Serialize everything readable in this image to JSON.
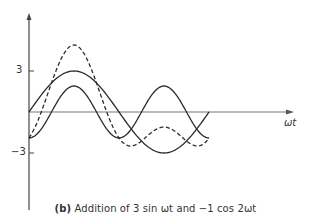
{
  "figure": {
    "caption_tag": "(b)",
    "caption_text": "Addition of 3 sin ωt and −1 cos 2ωt",
    "x_axis_label": "ωt",
    "y_ticks": [
      {
        "label": "3",
        "value": 3
      },
      {
        "label": "−3",
        "value": -3
      }
    ]
  },
  "chart_data": {
    "type": "line",
    "title": "(b) Addition of 3 sin ωt and −1 cos 2ωt",
    "xlabel": "ωt",
    "ylabel": "",
    "x_range_degrees": [
      0,
      360
    ],
    "yticks": [
      3,
      -3
    ],
    "grid": false,
    "legend": "none",
    "series": [
      {
        "name": "3 sin ωt",
        "style": "solid",
        "peak": 3,
        "trough": -3,
        "x_at_peak_deg": 90,
        "x_at_trough_deg": 270
      },
      {
        "name": "−1 cos 2ωt",
        "style": "solid",
        "values_at_deg": {
          "0": -1,
          "90": 1,
          "180": -1,
          "270": 1,
          "360": -1
        }
      },
      {
        "name": "3 sin ωt − 1 cos 2ωt (sum)",
        "style": "dashed",
        "values_at_deg": {
          "0": -1,
          "90": 4,
          "180": -1,
          "270": -2,
          "360": -1
        }
      }
    ]
  },
  "colors": {
    "line": "#2a2a2a",
    "axis": "#555555"
  }
}
